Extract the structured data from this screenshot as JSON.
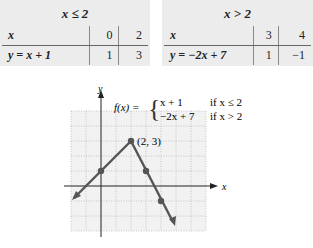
{
  "table_left": {
    "condition": "x ≤ 2",
    "header_label": "x",
    "row_label": "y = x + 1",
    "x_values": [
      "0",
      "2"
    ],
    "y_values": [
      "1",
      "3"
    ]
  },
  "table_right": {
    "condition": "x > 2",
    "header_label": "x",
    "row_label": "y = −2x + 7",
    "x_values": [
      "3",
      "4"
    ],
    "y_values": [
      "1",
      "−1"
    ]
  },
  "graph": {
    "y_axis_label": "y",
    "x_axis_label": "x",
    "function_name": "f(x) =",
    "piece1_expr": "x + 1",
    "piece1_cond": "if x ≤ 2",
    "piece2_expr": "−2x + 7",
    "piece2_cond": "if x > 2",
    "vertex_label": "(2, 3)",
    "line_color": "#555555",
    "points": [
      [
        0,
        1
      ],
      [
        2,
        3
      ],
      [
        3,
        1
      ],
      [
        4,
        -1
      ]
    ]
  }
}
